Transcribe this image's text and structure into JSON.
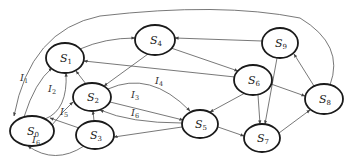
{
  "diagram": {
    "type": "state-transition-graph",
    "nodes": [
      {
        "id": "S0",
        "base": "S",
        "sub": "0",
        "cx": 32,
        "cy": 131,
        "rx": 22,
        "ry": 15
      },
      {
        "id": "S1",
        "base": "S",
        "sub": "1",
        "cx": 65,
        "cy": 58,
        "rx": 19,
        "ry": 15
      },
      {
        "id": "S2",
        "base": "S",
        "sub": "2",
        "cx": 92,
        "cy": 97,
        "rx": 19,
        "ry": 14
      },
      {
        "id": "S3",
        "base": "S",
        "sub": "3",
        "cx": 95,
        "cy": 135,
        "rx": 19,
        "ry": 14
      },
      {
        "id": "S4",
        "base": "S",
        "sub": "4",
        "cx": 155,
        "cy": 40,
        "rx": 20,
        "ry": 15
      },
      {
        "id": "S5",
        "base": "S",
        "sub": "5",
        "cx": 200,
        "cy": 124,
        "rx": 18,
        "ry": 14
      },
      {
        "id": "S6",
        "base": "S",
        "sub": "6",
        "cx": 253,
        "cy": 80,
        "rx": 19,
        "ry": 15
      },
      {
        "id": "S7",
        "base": "S",
        "sub": "7",
        "cx": 262,
        "cy": 138,
        "rx": 18,
        "ry": 14
      },
      {
        "id": "S8",
        "base": "S",
        "sub": "8",
        "cx": 324,
        "cy": 99,
        "rx": 19,
        "ry": 15
      },
      {
        "id": "S9",
        "base": "S",
        "sub": "9",
        "cx": 280,
        "cy": 43,
        "rx": 18,
        "ry": 15
      }
    ],
    "edges": [
      {
        "from": "S0",
        "to": "S1",
        "label": "I1",
        "d": "M 24 117 Q 35 82 52 68"
      },
      {
        "from": "S0",
        "to": "S1",
        "label": "I2",
        "d": "M 45 119 Q 68 110 66 73"
      },
      {
        "from": "S0",
        "to": "S2",
        "label": "",
        "d": "M 52 125 Q 62 112 73 102"
      },
      {
        "from": "S1",
        "to": "S4",
        "label": "",
        "d": "M 80 49 Q 105 38 135 38"
      },
      {
        "from": "S2",
        "to": "S1",
        "label": "",
        "d": "M 86 84 L 76 71"
      },
      {
        "from": "S2",
        "to": "S5",
        "label": "I3",
        "d": "M 110 102 L 183 120"
      },
      {
        "from": "S2",
        "to": "S5",
        "label": "I4",
        "d": "M 108 89 Q 150 70 190 111"
      },
      {
        "from": "S5",
        "to": "S2",
        "label": "I6",
        "d": "M 182 123 Q 130 123 100 110"
      },
      {
        "from": "S3",
        "to": "S2",
        "label": "",
        "d": "M 94 121 L 93 111"
      },
      {
        "from": "S3",
        "to": "S0",
        "label": "I5",
        "d": "M 79 128 L 50 118"
      },
      {
        "from": "S3",
        "to": "S0",
        "label": "I6",
        "d": "M 84 146 Q 55 165 28 146"
      },
      {
        "from": "S5",
        "to": "S3",
        "label": "",
        "d": "M 182 127 L 114 137"
      },
      {
        "from": "S4",
        "to": "S2",
        "label": "",
        "d": "M 148 54 L 104 86"
      },
      {
        "from": "S4",
        "to": "S6",
        "label": "",
        "d": "M 171 48 L 238 71"
      },
      {
        "from": "S6",
        "to": "S1",
        "label": "",
        "d": "M 235 77 L 84 61"
      },
      {
        "from": "S6",
        "to": "S5",
        "label": "",
        "d": "M 245 93 L 210 112"
      },
      {
        "from": "S6",
        "to": "S7",
        "label": "",
        "d": "M 258 95 L 260 124"
      },
      {
        "from": "S6",
        "to": "S8",
        "label": "",
        "d": "M 271 84 L 305 96"
      },
      {
        "from": "S9",
        "to": "S4",
        "label": "",
        "d": "M 262 41 L 175 38"
      },
      {
        "from": "S9",
        "to": "S7",
        "label": "",
        "d": "M 277 58 L 265 124"
      },
      {
        "from": "S5",
        "to": "S7",
        "label": "",
        "d": "M 218 127 L 244 136"
      },
      {
        "from": "S7",
        "to": "S8",
        "label": "",
        "d": "M 279 133 L 310 110"
      },
      {
        "from": "S8",
        "to": "S9",
        "label": "",
        "d": "M 314 86 L 294 54"
      },
      {
        "from": "S8",
        "to": "S0",
        "label": "",
        "d": "M 330 85 Q 345 45 300 18 Q 220 2 100 16 Q 30 30 14 116"
      }
    ],
    "edge_labels": [
      {
        "base": "I",
        "sub": "1",
        "x": 20,
        "y": 81
      },
      {
        "base": "I",
        "sub": "2",
        "x": 48,
        "y": 92
      },
      {
        "base": "I",
        "sub": "3",
        "x": 131,
        "y": 98
      },
      {
        "base": "I",
        "sub": "4",
        "x": 155,
        "y": 84
      },
      {
        "base": "I",
        "sub": "6",
        "x": 131,
        "y": 116
      },
      {
        "base": "I",
        "sub": "5",
        "x": 60,
        "y": 115
      },
      {
        "base": "I",
        "sub": "6",
        "x": 32,
        "y": 143
      }
    ],
    "colors": {
      "node_stroke": "#1a1a1a",
      "edge_stroke": "#555555",
      "text": "#222222",
      "background": "#ffffff"
    }
  }
}
